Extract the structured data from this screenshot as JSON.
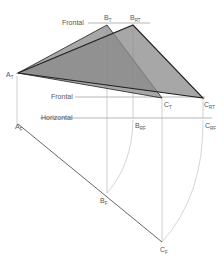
{
  "diagram": {
    "type": "descriptive-geometry-rotation",
    "colors": {
      "triangle_fill": "#8a8a8a",
      "triangle_stroke": "#333333",
      "construction_line": "#9a9a9a",
      "edge_view_line": "#666666",
      "label": "#555555"
    },
    "reference_lines": [
      {
        "label": "Frontal",
        "y": 23,
        "x1": 88,
        "x2": 150,
        "label_x": 62
      },
      {
        "label": "Frontal",
        "y": 97,
        "x1": 75,
        "x2": 205,
        "label_x": 50
      },
      {
        "label": "Horizontal",
        "y": 118,
        "x1": 40,
        "x2": 212,
        "label_x": 40
      }
    ],
    "points": {
      "A_T": {
        "main": "A",
        "sub": "T",
        "x": 18,
        "y": 73
      },
      "B_T": {
        "main": "B",
        "sub": "T",
        "x": 107,
        "y": 25
      },
      "B_RT": {
        "main": "B",
        "sub": "RT",
        "x": 133,
        "y": 25
      },
      "C_T": {
        "main": "C",
        "sub": "T",
        "x": 162,
        "y": 98
      },
      "C_RT": {
        "main": "C",
        "sub": "RT",
        "x": 203,
        "y": 98
      },
      "A_F": {
        "main": "A",
        "sub": "F",
        "x": 18,
        "y": 124
      },
      "B_RF": {
        "main": "B",
        "sub": "RF",
        "x": 133,
        "y": 118
      },
      "C_RF": {
        "main": "C",
        "sub": "RF",
        "x": 203,
        "y": 118
      },
      "B_F": {
        "main": "B",
        "sub": "F",
        "x": 107,
        "y": 193
      },
      "C_F": {
        "main": "C",
        "sub": "F",
        "x": 162,
        "y": 242
      }
    },
    "labels": {
      "frontal_top": "Frontal",
      "frontal_bottom": "Frontal",
      "horizontal": "Horizontal",
      "A_T": "A",
      "A_T_sub": "T",
      "B_T": "B",
      "B_T_sub": "T",
      "B_RT": "B",
      "B_RT_sub": "RT",
      "C_T": "C",
      "C_T_sub": "T",
      "C_RT": "C",
      "C_RT_sub": "RT",
      "A_F": "A",
      "A_F_sub": "F",
      "B_RF": "B",
      "B_RF_sub": "RF",
      "C_RF": "C",
      "C_RF_sub": "RF",
      "B_F": "B",
      "B_F_sub": "F",
      "C_F": "C",
      "C_F_sub": "F"
    }
  }
}
